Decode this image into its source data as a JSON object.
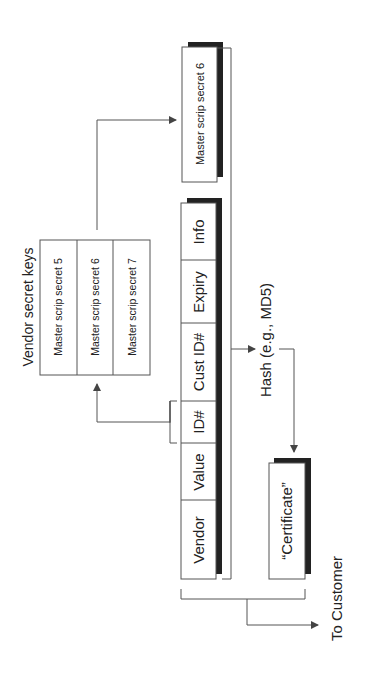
{
  "diagram": {
    "record_fields": [
      {
        "label": "Vendor"
      },
      {
        "label": "Value"
      },
      {
        "label": "ID#"
      },
      {
        "label": "Cust ID#"
      },
      {
        "label": "Expiry"
      },
      {
        "label": "Info"
      }
    ],
    "vendor_keys": {
      "title": "Vendor secret keys",
      "items": [
        "Master scrip secret 5",
        "Master scrip secret 6",
        "Master scrip secret 7"
      ]
    },
    "selected_secret": "Master scrip secret 6",
    "hash_label": "Hash (e.g., MD5)",
    "certificate_label": "“Certificate”",
    "output_label": "To Customer",
    "colors": {
      "line": "#555555",
      "shadow": "#222222",
      "box_fill": "#ffffff"
    }
  }
}
